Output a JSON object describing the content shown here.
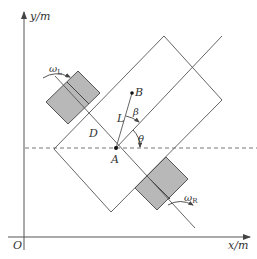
{
  "diagram": {
    "type": "differential-drive robot kinematics",
    "axes": {
      "x_label": "x/m",
      "y_label": "y/m",
      "origin_label": "O"
    },
    "points": {
      "A": "A",
      "B": "B",
      "D": "D"
    },
    "symbols": {
      "length": "L",
      "beta": "β",
      "theta": "θ",
      "omega_left": "ω",
      "omega_left_sub": "L",
      "omega_right": "ω",
      "omega_right_sub": "R"
    },
    "colors": {
      "line": "#555555",
      "wheel_fill": "#b8b8b8",
      "text": "#333333"
    }
  }
}
